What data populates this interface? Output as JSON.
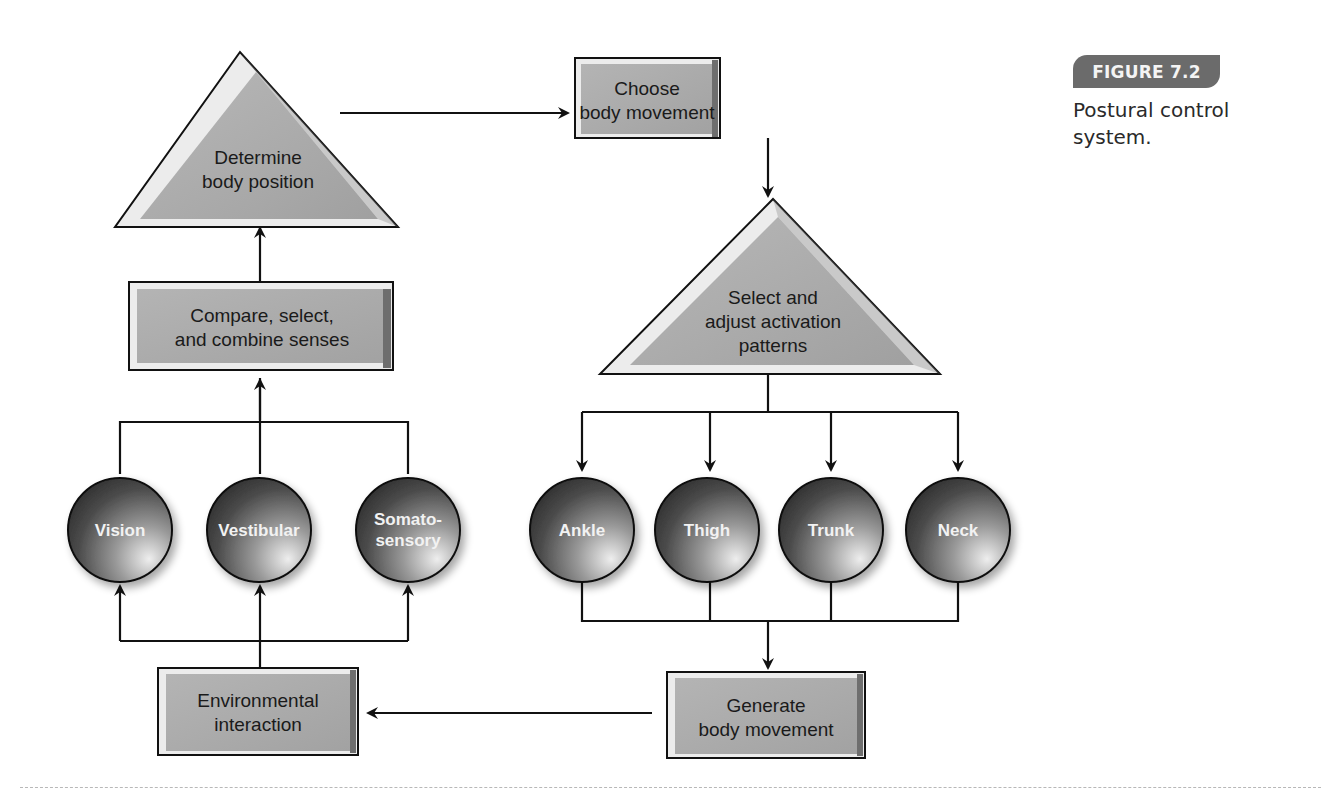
{
  "figure": {
    "badge": "FIGURE 7.2",
    "caption": "Postural control system."
  },
  "nodes": {
    "determine_position": {
      "line1": "Determine",
      "line2": "body position"
    },
    "compare_senses": {
      "line1": "Compare, select,",
      "line2": "and combine senses"
    },
    "choose_movement": {
      "line1": "Choose",
      "line2": "body movement"
    },
    "select_patterns": {
      "line1": "Select and",
      "line2": "adjust activation",
      "line3": "patterns"
    },
    "environmental": {
      "line1": "Environmental",
      "line2": "interaction"
    },
    "generate_movement": {
      "line1": "Generate",
      "line2": "body movement"
    }
  },
  "senses": [
    {
      "label": "Vision"
    },
    {
      "label": "Vestibular"
    },
    {
      "label": "Somato-",
      "label2": "sensory"
    }
  ],
  "body_segments": [
    {
      "label": "Ankle"
    },
    {
      "label": "Thigh"
    },
    {
      "label": "Trunk"
    },
    {
      "label": "Neck"
    }
  ],
  "colors": {
    "box_fill": "#a8a8a8",
    "circle_dark": "#3a3a3a",
    "circle_light": "#d8d8d8",
    "badge": "#6b6b6b"
  }
}
